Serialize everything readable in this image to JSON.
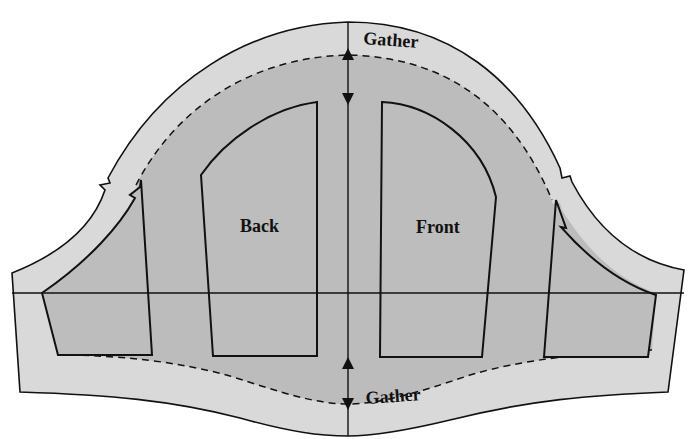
{
  "diagram": {
    "type": "sewing-pattern",
    "colors": {
      "background": "#ffffff",
      "seam_allowance": "#d9d9d9",
      "pattern_fill": "#b8b8b8",
      "piece_fill": "#bdbdbd",
      "line": "#111111"
    },
    "labels": {
      "gather_top": "Gather",
      "gather_bottom": "Gather",
      "back": "Back",
      "front": "Front"
    },
    "pieces": [
      {
        "name": "back",
        "label": "Back"
      },
      {
        "name": "front",
        "label": "Front"
      },
      {
        "name": "left-sleeve-side",
        "label": ""
      },
      {
        "name": "right-sleeve-side",
        "label": ""
      }
    ],
    "markings": [
      "grainline-arrow-top",
      "grainline-arrow-bottom",
      "notch-left-single",
      "notch-right-single",
      "horizontal-guide-line",
      "vertical-center-line",
      "dashed-gather-line-top",
      "dashed-gather-line-bottom"
    ]
  }
}
